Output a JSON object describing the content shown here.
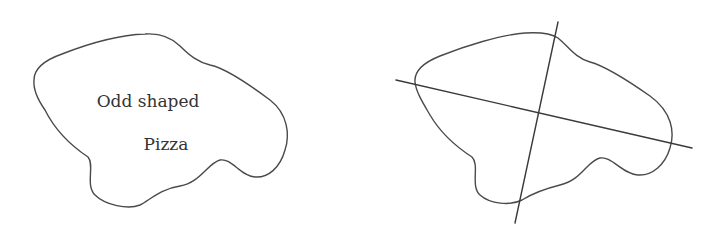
{
  "diagram": {
    "left_panel": {
      "description": "Odd shaped pizza outline",
      "label_line1": "Odd shaped",
      "label_line2": "Pizza"
    },
    "right_panel": {
      "description": "Same odd shaped pizza cut by two intersecting straight lines into four pieces",
      "cut_lines": 2
    },
    "colors": {
      "stroke": "#4a4a4a",
      "text": "#333333",
      "background": "#ffffff"
    }
  }
}
